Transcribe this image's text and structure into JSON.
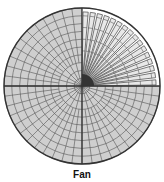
{
  "caption": "Fan",
  "diagram": {
    "center": [
      82,
      86
    ],
    "radius": 78,
    "rings": 10,
    "spokes": 48,
    "fan_quadrant": "upper-right",
    "colors": {
      "fill": "#cfcfcf",
      "grid": "#555555",
      "outline": "#333333",
      "fan_fill": "#ffffff",
      "fan_stroke": "#444444"
    }
  }
}
